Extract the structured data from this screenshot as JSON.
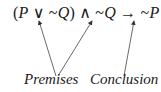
{
  "formula": {
    "open_paren": "(",
    "p1": "P",
    "or": " ∨ ",
    "neg1": "~",
    "q1": "Q",
    "close_paren": ")",
    "and": " ∧ ",
    "neg2": "~",
    "q2": "Q",
    "implies": " → ",
    "neg3": "~",
    "p2": "P"
  },
  "labels": {
    "premises": "Premises",
    "conclusion": "Conclusion"
  },
  "arrows": [
    {
      "from": "premises",
      "to": "P ∨ ~Q"
    },
    {
      "from": "premises",
      "to": "~Q"
    },
    {
      "from": "conclusion",
      "to": "~P"
    }
  ]
}
